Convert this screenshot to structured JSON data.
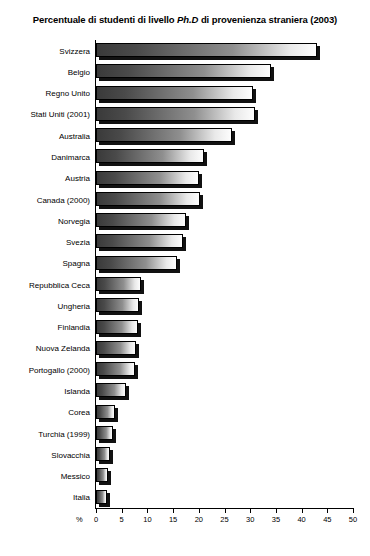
{
  "chart_data": {
    "type": "bar",
    "orientation": "horizontal",
    "title": "Percentuale di studenti di livello Ph.D di provenienza straniera (2003)",
    "title_parts": {
      "before_italic": "Percentuale di studenti di livello ",
      "italic": "Ph.D",
      "after_italic": " di provenienza straniera (2003)"
    },
    "xlabel": "%",
    "ylabel": "",
    "xlim": [
      0,
      50
    ],
    "xticks": [
      0,
      5,
      10,
      15,
      20,
      25,
      30,
      35,
      40,
      45,
      50
    ],
    "xtick_labels": [
      "0",
      "5",
      "10",
      "15",
      "20",
      "25",
      "30",
      "35",
      "40",
      "45",
      "50"
    ],
    "grid": false,
    "legend": "none",
    "categories": [
      "Svizzera",
      "Belgio",
      "Regno Unito",
      "Stati Uniti (2001)",
      "Australia",
      "Danimarca",
      "Austria",
      "Canada (2000)",
      "Norvegia",
      "Svezia",
      "Spagna",
      "Repubblica Ceca",
      "Ungheria",
      "Finlandia",
      "Nuova Zelanda",
      "Portogallo (2000)",
      "Islanda",
      "Corea",
      "Turchia (1999)",
      "Slovacchia",
      "Messico",
      "Italia"
    ],
    "values": [
      43,
      34,
      30.5,
      31,
      26.5,
      21,
      20,
      20.2,
      17.5,
      17,
      15.8,
      8.7,
      8.3,
      8.2,
      7.8,
      7.6,
      5.8,
      3.7,
      3.3,
      2.7,
      2.3,
      2.1
    ]
  },
  "colors": {
    "bar_dark": "#3a3a3a",
    "bar_light": "#fdfdfd",
    "shadow": "#111111",
    "axis": "#000000",
    "background": "#ffffff"
  }
}
